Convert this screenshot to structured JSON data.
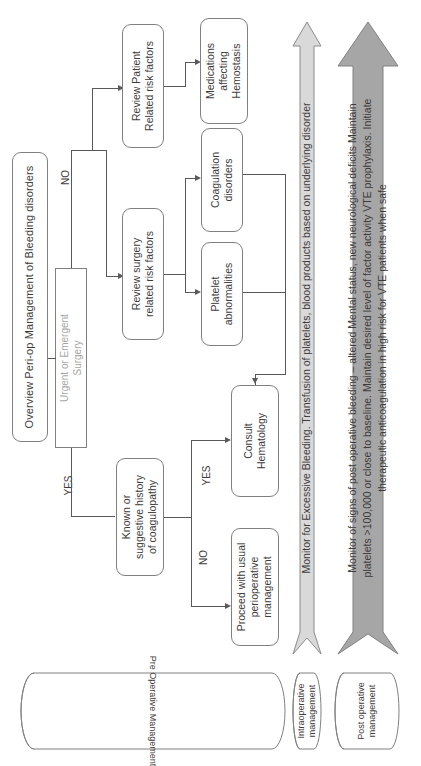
{
  "diagram": {
    "title": "Overview Peri-op Management of Bleeding disorders",
    "orientation": "rotated-90-clockwise"
  },
  "nodes": {
    "title_box": {
      "label": "Overview Peri-op Management of Bleeding disorders"
    },
    "urgent_surgery": {
      "label_line1": "Urgent or Emergent",
      "label_line2": "Surgery"
    },
    "known_history": {
      "label_line1": "Known or",
      "label_line2": "suggestive history",
      "label_line3": "of coagulopathy"
    },
    "consult_hematology": {
      "label_line1": "Consult",
      "label_line2": "Hematology"
    },
    "proceed_usual": {
      "label_line1": "Proceed with usual",
      "label_line2": "perioperative",
      "label_line3": "management"
    },
    "review_surgery": {
      "label_line1": "Review surgery",
      "label_line2": "related risk factors"
    },
    "review_patient": {
      "label_line1": "Review Patient",
      "label_line2": "Related risk factors"
    },
    "platelet": {
      "label_line1": "Platelet",
      "label_line2": "abnormalities"
    },
    "coagulation": {
      "label_line1": "Coagulation",
      "label_line2": "disorders"
    },
    "medications": {
      "label_line1": "Medications",
      "label_line2": "affecting",
      "label_line3": "Hemostasis"
    }
  },
  "edge_labels": {
    "yes_top": "YES",
    "no_top": "NO",
    "yes_bottom": "YES",
    "no_bottom": "NO"
  },
  "arrows": {
    "intraoperative": {
      "text_line1": "Monitor for Excessive Bleeding. Transfusion of platelets, blood products based on underlying disorder",
      "fill": "#d9d9d9",
      "stroke": "#8c8c8c"
    },
    "postoperative": {
      "text_line1": "Monitor of signs of post operative bleeding – altered Mental status, new neurological deficits Maintain",
      "text_line2": "platelets >100,000 or close to baseline. Maintain desired level of factor activity VTE prophylaxis. Initiate",
      "text_line3": "therapeutic anticoagulation in high risk for VTE patients when safe",
      "fill": "#a6a6a6",
      "stroke": "#808080"
    }
  },
  "phases": {
    "pre": {
      "label": "Pre Operative Management"
    },
    "intra": {
      "label_line1": "Intraoperative",
      "label_line2": "management"
    },
    "post": {
      "label_line1": "Post operative",
      "label_line2": "management"
    }
  },
  "colors": {
    "node_border": "#808080",
    "connector": "#595959",
    "text": "#3c3c3c",
    "muted_text": "#a6a6a6",
    "arrow_light": "#d9d9d9",
    "arrow_dark": "#a6a6a6",
    "background": "#ffffff"
  }
}
